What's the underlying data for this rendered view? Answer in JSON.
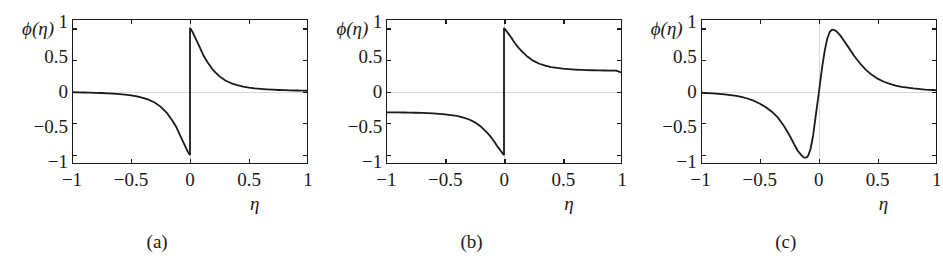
{
  "figure": {
    "axis_label_y": "ϕ(η)",
    "axis_label_x": "η",
    "line_color": "#1a1a1a",
    "frame_color": "#1a1a1a",
    "grid_color": "#d8d8d8",
    "background": "#ffffff"
  },
  "panels": [
    {
      "caption": "(a)"
    },
    {
      "caption": "(b)"
    },
    {
      "caption": "(c)"
    }
  ],
  "chart_data": [
    {
      "type": "line",
      "title": "(a)",
      "xlabel": "η",
      "ylabel": "ϕ(η)",
      "xlim": [
        -1,
        1
      ],
      "ylim": [
        -1.15,
        1.15
      ],
      "xticks": [
        -1,
        -0.5,
        0,
        0.5,
        1
      ],
      "xticklabels": [
        "−1",
        "−0.5",
        "0",
        "0.5",
        "1"
      ],
      "yticks": [
        -1,
        -0.5,
        0,
        0.5,
        1
      ],
      "yticklabels": [
        "−1",
        "−0.5",
        "0",
        "0.5",
        "1"
      ],
      "grid": false,
      "legend": "none",
      "description": "Odd, discontinuous at eta=0. Jumps from -1 (left of 0) to +1 (right of 0); decays toward 0 at both ends.",
      "series": [
        {
          "name": "phi_a",
          "x": [
            -1.0,
            -0.95,
            -0.9,
            -0.85,
            -0.8,
            -0.75,
            -0.7,
            -0.65,
            -0.6,
            -0.55,
            -0.5,
            -0.45,
            -0.4,
            -0.35,
            -0.3,
            -0.25,
            -0.2,
            -0.15,
            -0.12,
            -0.1,
            -0.08,
            -0.06,
            -0.04,
            -0.02,
            -0.01,
            -0.004,
            0.0
          ],
          "y": [
            -0.012,
            -0.014,
            -0.016,
            -0.018,
            -0.021,
            -0.024,
            -0.029,
            -0.034,
            -0.041,
            -0.05,
            -0.062,
            -0.078,
            -0.1,
            -0.13,
            -0.175,
            -0.24,
            -0.33,
            -0.46,
            -0.55,
            -0.63,
            -0.71,
            -0.79,
            -0.87,
            -0.95,
            -0.98,
            -1.0,
            -1.0
          ]
        },
        {
          "name": "phi_a_right",
          "x": [
            0.0,
            0.004,
            0.01,
            0.02,
            0.04,
            0.06,
            0.08,
            0.1,
            0.12,
            0.15,
            0.2,
            0.25,
            0.3,
            0.35,
            0.4,
            0.45,
            0.5,
            0.55,
            0.6,
            0.65,
            0.7,
            0.75,
            0.8,
            0.85,
            0.9,
            0.95,
            1.0
          ],
          "y": [
            1.0,
            1.0,
            0.98,
            0.95,
            0.87,
            0.79,
            0.71,
            0.63,
            0.55,
            0.46,
            0.33,
            0.24,
            0.175,
            0.13,
            0.1,
            0.078,
            0.062,
            0.05,
            0.041,
            0.034,
            0.029,
            0.024,
            0.021,
            0.018,
            0.016,
            0.014,
            0.012
          ]
        }
      ]
    },
    {
      "type": "line",
      "title": "(b)",
      "xlabel": "η",
      "ylabel": "ϕ(η)",
      "xlim": [
        -1,
        1
      ],
      "ylim": [
        -1.15,
        1.15
      ],
      "xticks": [
        -1,
        -0.5,
        0,
        0.5,
        1
      ],
      "xticklabels": [
        "−1",
        "−0.5",
        "0",
        "0.5",
        "1"
      ],
      "yticks": [
        -1,
        -0.5,
        0,
        0.5,
        1
      ],
      "yticklabels": [
        "−1",
        "−0.5",
        "0",
        "0.5",
        "1"
      ],
      "grid": false,
      "legend": "none",
      "description": "Odd, discontinuous at eta=0. Jumps from -1 to +1 at origin; asymptotes to +0.30 as eta->1 and -0.33 as eta->-1.",
      "series": [
        {
          "name": "phi_b_left",
          "x": [
            -1.0,
            -0.95,
            -0.9,
            -0.85,
            -0.8,
            -0.75,
            -0.7,
            -0.65,
            -0.6,
            -0.55,
            -0.5,
            -0.45,
            -0.4,
            -0.35,
            -0.3,
            -0.25,
            -0.2,
            -0.15,
            -0.12,
            -0.1,
            -0.08,
            -0.06,
            -0.04,
            -0.02,
            -0.01,
            -0.004,
            0.0
          ],
          "y": [
            -0.33,
            -0.331,
            -0.332,
            -0.333,
            -0.335,
            -0.337,
            -0.34,
            -0.343,
            -0.348,
            -0.354,
            -0.362,
            -0.373,
            -0.388,
            -0.41,
            -0.44,
            -0.485,
            -0.55,
            -0.64,
            -0.7,
            -0.75,
            -0.8,
            -0.86,
            -0.91,
            -0.96,
            -0.985,
            -1.0,
            -1.0
          ]
        },
        {
          "name": "phi_b_right",
          "x": [
            0.0,
            0.004,
            0.01,
            0.02,
            0.04,
            0.06,
            0.08,
            0.1,
            0.12,
            0.15,
            0.2,
            0.25,
            0.3,
            0.35,
            0.4,
            0.45,
            0.5,
            0.55,
            0.6,
            0.65,
            0.7,
            0.75,
            0.8,
            0.85,
            0.9,
            0.95,
            1.0
          ],
          "y": [
            1.0,
            1.0,
            0.985,
            0.96,
            0.91,
            0.86,
            0.8,
            0.75,
            0.7,
            0.64,
            0.55,
            0.485,
            0.44,
            0.41,
            0.388,
            0.373,
            0.362,
            0.354,
            0.348,
            0.343,
            0.34,
            0.337,
            0.335,
            0.333,
            0.332,
            0.331,
            0.3
          ]
        }
      ]
    },
    {
      "type": "line",
      "title": "(c)",
      "xlabel": "η",
      "ylabel": "ϕ(η)",
      "xlim": [
        -1,
        1
      ],
      "ylim": [
        -1.15,
        1.15
      ],
      "xticks": [
        -1,
        -0.5,
        0,
        0.5,
        1
      ],
      "xticklabels": [
        "−1",
        "−0.5",
        "0",
        "0.5",
        "1"
      ],
      "yticks": [
        -1,
        -0.5,
        0,
        0.5,
        1
      ],
      "yticklabels": [
        "−1",
        "−0.5",
        "0",
        "0.5",
        "1"
      ],
      "grid": false,
      "legend": "none",
      "description": "Smooth odd S-shaped (derivative-of-Gaussian-like) curve. Minimum about -1.05 near eta = -0.10, maximum about +0.98 near eta = +0.11, decays to 0 at both ends.",
      "series": [
        {
          "name": "phi_c",
          "x": [
            -1.0,
            -0.9,
            -0.8,
            -0.7,
            -0.65,
            -0.6,
            -0.55,
            -0.5,
            -0.45,
            -0.4,
            -0.35,
            -0.3,
            -0.27,
            -0.24,
            -0.21,
            -0.18,
            -0.15,
            -0.13,
            -0.11,
            -0.1,
            -0.09,
            -0.07,
            -0.05,
            -0.03,
            -0.015,
            0.0,
            0.015,
            0.03,
            0.05,
            0.07,
            0.09,
            0.11,
            0.13,
            0.15,
            0.18,
            0.21,
            0.25,
            0.3,
            0.35,
            0.4,
            0.45,
            0.5,
            0.55,
            0.6,
            0.65,
            0.7,
            0.8,
            0.9,
            1.0
          ],
          "y": [
            -0.02,
            -0.03,
            -0.045,
            -0.07,
            -0.09,
            -0.115,
            -0.15,
            -0.195,
            -0.25,
            -0.32,
            -0.41,
            -0.54,
            -0.63,
            -0.73,
            -0.84,
            -0.94,
            -1.01,
            -1.045,
            -1.05,
            -1.04,
            -1.01,
            -0.9,
            -0.7,
            -0.42,
            -0.21,
            0.0,
            0.22,
            0.43,
            0.66,
            0.84,
            0.94,
            0.98,
            0.975,
            0.95,
            0.89,
            0.81,
            0.7,
            0.56,
            0.44,
            0.34,
            0.26,
            0.2,
            0.155,
            0.12,
            0.095,
            0.075,
            0.048,
            0.03,
            0.02
          ]
        }
      ]
    }
  ]
}
